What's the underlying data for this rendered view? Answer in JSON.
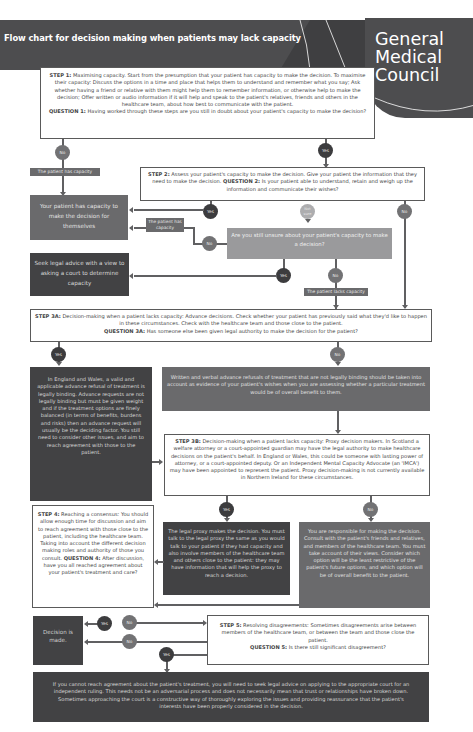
{
  "header": {
    "title": "Flow chart for decision making when patients may lack capacity",
    "logo": [
      "General",
      "Medical",
      "Council"
    ]
  },
  "step1": {
    "label": "STEP 1:",
    "text": "Maximising capacity. Start from the presumption that your patient has capacity to make the decision. To maximise their capacity: Discuss the options in a time and place that helps them to understand and remember what you say; Ask whether having a friend or relative with them might help them to remember information, or otherwise help to make the decision; Offer written or audio information if it will help and speak to the patient's relatives, friends and others in the healthcare team, about how best to communicate with the patient.",
    "question_label": "QUESTION 1:",
    "question": "Having worked through these steps are you still in doubt about your patient's capacity to make the decision?"
  },
  "step2": {
    "label": "STEP 2:",
    "text": "Assess your patient's capacity to make the decision. Give your patient the information that they need to make the decision.",
    "question_label": "QUESTION 2:",
    "question": "Is your patient able to understand, retain and weigh up the information and communicate their wishes?"
  },
  "unsure_box": "Are you still unsure about your patient's capacity to make a decision?",
  "has_capacity_box": "Your patient has capacity to make the decision for themselves",
  "legal_advice_box": "Seek legal advice with a view to asking a court to determine capacity",
  "tags": {
    "has_capacity_1": "The patient has capacity",
    "has_capacity_2": "The patient has capacity",
    "lacks_capacity": "The patient lacks capacity"
  },
  "circles": {
    "q1_no": "No",
    "q1_yes": "Yes",
    "q2_yes": "Yes",
    "q2_not_sure": "Not sure",
    "q2_no": "No",
    "unsure_no": "No",
    "unsure_yes": "Yes",
    "unsure_no2": "No",
    "q3a_yes": "Yes",
    "q3a_no": "No",
    "q3b_yes": "Yes",
    "q3b_no": "No",
    "q4_yes": "Yes",
    "q4_no": "No",
    "q5_no": "No",
    "q5_yes": "Yes"
  },
  "step3a": {
    "label": "STEP 3A:",
    "text": "Decision-making when a patient lacks capacity: Advance decisions. Check whether your patient has previously said what they'd like to happen in these circumstances. Check with the healthcare team and those close to the patient.",
    "question_label": "QUESTION 3A:",
    "question": "Has someone else been given legal authority to make the decision for the patient?"
  },
  "advance_refusal_box": "In England and Wales, a valid and applicable advance refusal of treatment is legally binding. Advance requests are not legally binding but must be given weight and if the treatment options are finely balanced (in terms of benefits, burdens and risks) then an advance request will usually be the deciding factor. You still need to consider other issues, and aim to reach agreement with those to the patient.",
  "written_verbal_box": "Written and verbal advance refusals of treatment that are not legally binding should be taken into account as evidence of your patient's wishes when you are assessing whether a particular treatment would be of overall benefit to them.",
  "step3b": {
    "label": "STEP 3B:",
    "text": "Decision-making when a patient lacks capacity: Proxy decision makers. In Scotland a welfare attorney or a court-appointed guardian may have the legal authority to make healthcare decisions on the patient's behalf. In England or Wales, this could be someone with lasting power of attorney, or a court-appointed deputy. Or an Independent Mental Capacity Advocate (an 'IMCA') may have been appointed to represent the patient. Proxy decision-making is not currently available in Northern Ireland for these circumstances."
  },
  "step4": {
    "label": "STEP 4:",
    "text": "Reaching a consensus: You should allow enough time for discussion and aim to reach agreement with those close to the patient, including the healthcare team. Taking into account the different decision making roles and authority of those you consult.",
    "question_label": "QUESTION 4:",
    "question": "After discussion, have you all reached agreement about your patient's treatment and care?"
  },
  "proxy_box": "The legal proxy makes the decision. You must talk to the legal proxy the same as you would talk to your patient if they had capacity and also involve members of the healthcare team and others close to the patient: they may have information that will help the proxy to reach a decision.",
  "responsible_box": "You are responsible for making the decision. Consult with the patient's friends and relatives, and members of the healthcare team. You must take account of their views. Consider which option will be the least restrictive of the patient's future options, and which option will be of overall benefit to the patient.",
  "decision_made_box": "Decision is made.",
  "step5": {
    "label": "STEP 5:",
    "text": "Resolving disagreements: Sometimes disagreements arise between members of the healthcare team, or between the team and those close the patient.",
    "question_label": "QUESTION 5:",
    "question": "Is there still significant disagreement?"
  },
  "court_box": "If you cannot reach agreement about the patient's treatment, you will need to seek legal advice on applying to the appropriate court for an independent ruling. This needs not be an adversarial process and does not necessarily mean that trust or relationships have broken down. Sometimes approaching the court is a constructive way of thoroughly exploring the issues and providing reassurance that the patient's interests have been properly considered in the decision."
}
